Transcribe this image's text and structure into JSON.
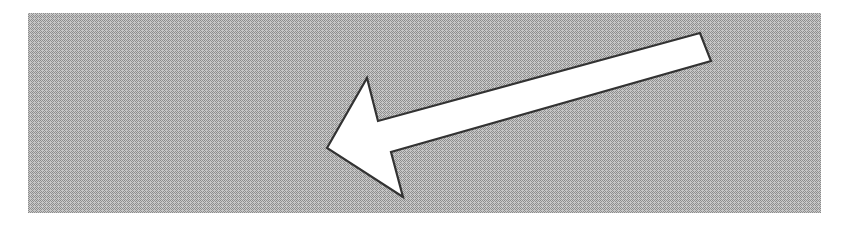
{
  "figure": {
    "kind": "illustration",
    "caption": "Large white block arrow pointing left over a gray halftone rectangle",
    "width": 850,
    "height": 226,
    "background_color": "#ffffff"
  },
  "panel": {
    "name": "gray-halftone-panel",
    "x": 28,
    "y": 13,
    "width": 793,
    "height": 200,
    "fill_color": "#b3b3b3",
    "dither_dark_color": "#8c8c8c",
    "dither_light_color": "#e8e8e8",
    "pattern": "halftone-checker"
  },
  "arrow": {
    "name": "left-pointing-block-arrow",
    "direction": "left",
    "fill_color": "#ffffff",
    "stroke_color": "#333333",
    "stroke_width": 2.2,
    "points": "327,148 367,78 378,121 700,33 711,61 391,152 403,197",
    "vertices": [
      {
        "label": "tip",
        "x": 327,
        "y": 148
      },
      {
        "label": "upper-barb-apex",
        "x": 367,
        "y": 78
      },
      {
        "label": "upper-notch",
        "x": 378,
        "y": 121
      },
      {
        "label": "tail-top-right",
        "x": 700,
        "y": 33
      },
      {
        "label": "tail-bottom-right",
        "x": 711,
        "y": 61
      },
      {
        "label": "lower-notch",
        "x": 391,
        "y": 152
      },
      {
        "label": "lower-barb-tip",
        "x": 403,
        "y": 197
      }
    ]
  }
}
